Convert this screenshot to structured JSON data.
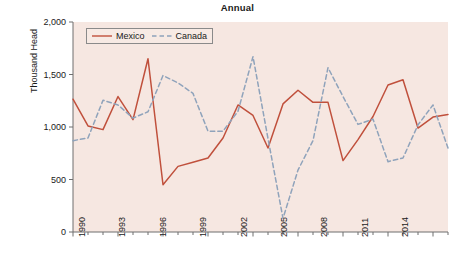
{
  "chart_data": {
    "type": "line",
    "title": "Annual",
    "xlabel": "",
    "ylabel": "Thousand Head",
    "xlim": [
      1990,
      2015
    ],
    "ylim": [
      0,
      2000
    ],
    "grid": false,
    "legend_position": "top-left inside",
    "ytick_labels": [
      "0",
      "500",
      "1,000",
      "1,500",
      "2,000"
    ],
    "ytick_values": [
      0,
      500,
      1000,
      1500,
      2000
    ],
    "xtick_labels": [
      "1990",
      "1993",
      "1996",
      "1999",
      "2002",
      "2005",
      "2008",
      "2011",
      "2014"
    ],
    "xtick_values": [
      1990,
      1993,
      1996,
      1999,
      2002,
      2005,
      2008,
      2011,
      2014
    ],
    "x": [
      1990,
      1991,
      1992,
      1993,
      1994,
      1995,
      1996,
      1997,
      1998,
      1999,
      2000,
      2001,
      2002,
      2003,
      2004,
      2005,
      2006,
      2007,
      2008,
      2009,
      2010,
      2011,
      2012,
      2013,
      2014,
      2015
    ],
    "series": [
      {
        "name": "Mexico",
        "color": "#c0503c",
        "style": "solid",
        "values": [
          1265,
          1010,
          975,
          1290,
          1070,
          1650,
          450,
          625,
          665,
          705,
          895,
          1210,
          1110,
          800,
          1220,
          1350,
          1235,
          1235,
          680,
          880,
          1100,
          1400,
          1450,
          990,
          1095,
          1120
        ]
      },
      {
        "name": "Canada",
        "color": "#8fa3bb",
        "style": "dashed",
        "values": [
          870,
          895,
          1255,
          1210,
          1085,
          1145,
          1490,
          1420,
          1320,
          960,
          960,
          1150,
          1670,
          890,
          130,
          590,
          870,
          1565,
          1290,
          1025,
          1075,
          670,
          705,
          1020,
          1210,
          800
        ]
      }
    ]
  },
  "legend": {
    "entries": [
      {
        "label": "Mexico"
      },
      {
        "label": "Canada"
      }
    ]
  }
}
